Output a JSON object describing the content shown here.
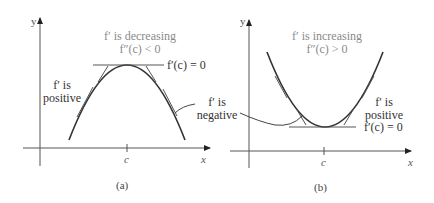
{
  "panels": [
    {
      "id": "a",
      "caption": "(a)",
      "axis_y": "y",
      "axis_x": "x",
      "tick_label": "c",
      "title_line1": "f′ is decreasing",
      "title_line2": "f″(c) < 0",
      "tangent_label": "f′(c) = 0",
      "left_note_line1": "f′ is",
      "left_note_line2": "positive",
      "curve": "concave-down parabola with peak at x = c"
    },
    {
      "id": "b",
      "caption": "(b)",
      "axis_y": "y",
      "axis_x": "x",
      "tick_label": "c",
      "title_line1": "f′ is increasing",
      "title_line2": "f″(c) > 0",
      "tangent_label": "f′(c) = 0",
      "right_note_line1": "f′ is",
      "right_note_line2": "positive",
      "curve": "concave-up parabola with minimum at x = c"
    }
  ],
  "shared_note": {
    "line1": "f′ is",
    "line2": "negative"
  },
  "colors": {
    "curve": "#333333",
    "tangent": "#555555",
    "title_text": "#8a8a8a",
    "axis": "#555555"
  }
}
